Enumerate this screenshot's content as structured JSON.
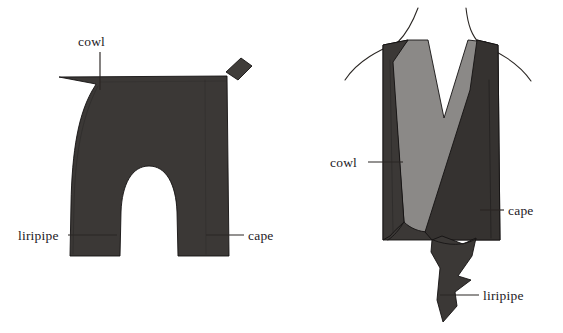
{
  "figure": {
    "title": "Cowl, cape and liripipe hood construction diagram",
    "background_color": "#ffffff",
    "colors": {
      "garment_dark": "#3b3836",
      "garment_dark_alt": "#353230",
      "garment_mid_dark": "#403d3a",
      "cowl_light_gray": "#8b8987",
      "outline": "#141212",
      "body_line": "#2b2724",
      "label_text": "#24201e",
      "leader_line": "#2a2624"
    },
    "panels": [
      {
        "id": "flat-pattern",
        "name": "flat-pattern-panel",
        "description": "Flat cut-out garment pattern with arched opening and small angled tab at top right"
      },
      {
        "id": "worn-garment",
        "name": "worn-garment-panel",
        "description": "Garment shown worn on a torso, cowl crossed over cape with liripipe tail hanging down"
      }
    ],
    "labels": [
      {
        "id": "left-cowl",
        "text": "cowl",
        "panel": "flat-pattern",
        "text_x": 78,
        "text_y": 46,
        "anchor": "start",
        "leader": "M 100 52 L 100 90"
      },
      {
        "id": "left-liripipe",
        "text": "liripipe",
        "panel": "flat-pattern",
        "text_x": 18,
        "text_y": 240,
        "anchor": "start",
        "leader": "M 68 235 L 117 235"
      },
      {
        "id": "left-cape",
        "text": "cape",
        "panel": "flat-pattern",
        "text_x": 248,
        "text_y": 240,
        "anchor": "start",
        "leader": "M 244 235 L 206 235"
      },
      {
        "id": "right-cowl",
        "text": "cowl",
        "panel": "worn-garment",
        "text_x": 330,
        "text_y": 167,
        "anchor": "start",
        "leader": "M 368 162 L 403 162"
      },
      {
        "id": "right-cape",
        "text": "cape",
        "panel": "worn-garment",
        "text_x": 508,
        "text_y": 215,
        "anchor": "start",
        "leader": "M 504 210 L 480 210"
      },
      {
        "id": "right-liripipe",
        "text": "liripipe",
        "panel": "worn-garment",
        "text_x": 483,
        "text_y": 300,
        "anchor": "start",
        "leader": "M 479 295 L 440 295"
      }
    ]
  }
}
